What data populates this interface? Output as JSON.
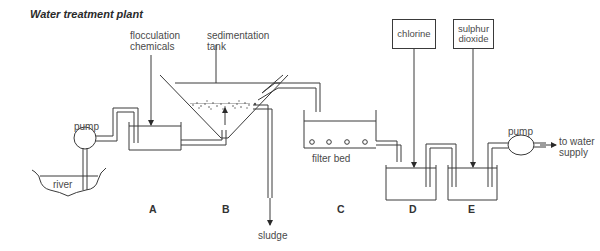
{
  "title": "Water treatment plant",
  "labels": {
    "flocculation": "flocculation",
    "chemicals": "chemicals",
    "sedimentation": "sedimentation",
    "tank": "tank",
    "pump_left": "pump",
    "river": "river",
    "filter_bed": "filter bed",
    "sludge": "sludge",
    "pump_right": "pump",
    "to_water": "to water",
    "supply": "supply"
  },
  "boxes": {
    "chlorine": "chlorine",
    "sulphur_1": "sulphur",
    "sulphur_2": "dioxide"
  },
  "stages": [
    "A",
    "B",
    "C",
    "D",
    "E"
  ],
  "colors": {
    "line": "#3a3a3a",
    "text": "#4a4a4a"
  }
}
